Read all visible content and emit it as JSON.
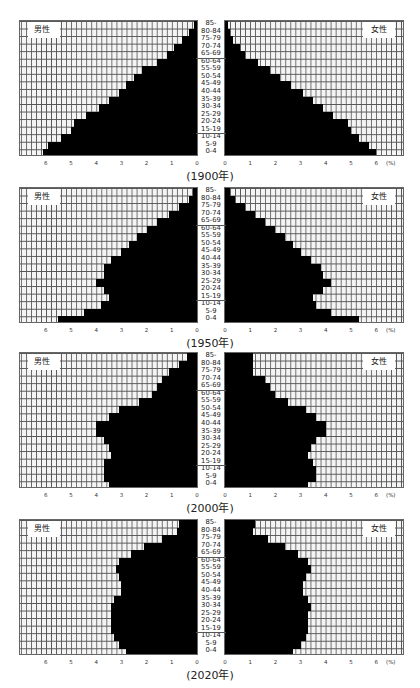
{
  "age_groups": [
    "0-4",
    "5-9",
    "10-14",
    "15-19",
    "20-24",
    "25-29",
    "30-34",
    "35-39",
    "40-44",
    "45-49",
    "50-54",
    "55-59",
    "60-64",
    "65-69",
    "70-74",
    "75-79",
    "80-84",
    "85-"
  ],
  "labels": {
    "male": "男性",
    "female": "女性",
    "percent_unit": "(%)"
  },
  "ticks": [
    "0",
    "1",
    "2",
    "3",
    "4",
    "5",
    "6"
  ],
  "colors": {
    "bar": "#000000",
    "grid": "#555555",
    "panel_bg": "#f4f4f4"
  },
  "chart_data": [
    {
      "type": "bar",
      "subtype": "population-pyramid",
      "title": "(1900年)",
      "categories": [
        "0-4",
        "5-9",
        "10-14",
        "15-19",
        "20-24",
        "25-29",
        "30-34",
        "35-39",
        "40-44",
        "45-49",
        "50-54",
        "55-59",
        "60-64",
        "65-69",
        "70-74",
        "75-79",
        "80-84",
        "85-"
      ],
      "series": [
        {
          "name": "男性",
          "values": [
            6.1,
            5.9,
            5.4,
            5.0,
            4.9,
            4.4,
            3.9,
            3.5,
            3.1,
            2.8,
            2.5,
            2.2,
            1.6,
            1.2,
            0.9,
            0.6,
            0.3,
            0.1
          ]
        },
        {
          "name": "女性",
          "values": [
            6.0,
            5.7,
            5.3,
            5.0,
            4.9,
            4.3,
            3.9,
            3.5,
            3.1,
            2.6,
            2.2,
            1.8,
            1.3,
            0.8,
            0.6,
            0.3,
            0.2,
            0.1
          ]
        }
      ],
      "xlabel": "(%)",
      "xlim": [
        0,
        7
      ],
      "grid": true
    },
    {
      "type": "bar",
      "subtype": "population-pyramid",
      "title": "(1950年)",
      "categories": [
        "0-4",
        "5-9",
        "10-14",
        "15-19",
        "20-24",
        "25-29",
        "30-34",
        "35-39",
        "40-44",
        "45-49",
        "50-54",
        "55-59",
        "60-64",
        "65-69",
        "70-74",
        "75-79",
        "80-84",
        "85-"
      ],
      "series": [
        {
          "name": "男性",
          "values": [
            5.5,
            4.5,
            3.8,
            3.5,
            3.7,
            4.0,
            3.7,
            3.7,
            3.4,
            3.0,
            2.7,
            2.4,
            2.0,
            1.6,
            1.1,
            0.7,
            0.3,
            0.15
          ]
        },
        {
          "name": "女性",
          "values": [
            5.3,
            4.2,
            3.6,
            3.5,
            3.9,
            4.2,
            3.9,
            3.8,
            3.4,
            3.0,
            2.7,
            2.4,
            2.0,
            1.6,
            1.2,
            0.8,
            0.4,
            0.2
          ]
        }
      ],
      "xlabel": "(%)",
      "xlim": [
        0,
        7
      ],
      "grid": true
    },
    {
      "type": "bar",
      "subtype": "population-pyramid",
      "title": "(2000年)",
      "categories": [
        "0-4",
        "5-9",
        "10-14",
        "15-19",
        "20-24",
        "25-29",
        "30-34",
        "35-39",
        "40-44",
        "45-49",
        "50-54",
        "55-59",
        "60-64",
        "65-69",
        "70-74",
        "75-79",
        "80-84",
        "85-"
      ],
      "series": [
        {
          "name": "男性",
          "values": [
            3.5,
            3.7,
            3.7,
            3.7,
            3.4,
            3.5,
            3.7,
            4.0,
            4.0,
            3.5,
            3.1,
            2.3,
            1.8,
            1.6,
            1.4,
            1.1,
            0.7,
            0.4
          ]
        },
        {
          "name": "女性",
          "values": [
            3.3,
            3.6,
            3.6,
            3.5,
            3.3,
            3.4,
            3.6,
            4.0,
            4.0,
            3.6,
            3.2,
            2.5,
            2.0,
            1.8,
            1.6,
            1.1,
            1.1,
            1.1
          ]
        }
      ],
      "xlabel": "(%)",
      "xlim": [
        0,
        7
      ],
      "grid": true
    },
    {
      "type": "bar",
      "subtype": "population-pyramid",
      "title": "(2020年)",
      "categories": [
        "0-4",
        "5-9",
        "10-14",
        "15-19",
        "20-24",
        "25-29",
        "30-34",
        "35-39",
        "40-44",
        "45-49",
        "50-54",
        "55-59",
        "60-64",
        "65-69",
        "70-74",
        "75-79",
        "80-84",
        "85-"
      ],
      "series": [
        {
          "name": "男性",
          "values": [
            2.8,
            3.1,
            3.3,
            3.4,
            3.4,
            3.4,
            3.4,
            3.3,
            3.0,
            3.0,
            3.1,
            3.2,
            3.1,
            2.6,
            2.1,
            1.4,
            0.8,
            0.7
          ]
        },
        {
          "name": "女性",
          "values": [
            2.7,
            3.0,
            3.2,
            3.3,
            3.3,
            3.3,
            3.4,
            3.3,
            3.1,
            3.1,
            3.2,
            3.4,
            3.3,
            2.9,
            2.4,
            1.7,
            1.1,
            1.2
          ]
        }
      ],
      "xlabel": "(%)",
      "xlim": [
        0,
        7
      ],
      "grid": true
    }
  ]
}
